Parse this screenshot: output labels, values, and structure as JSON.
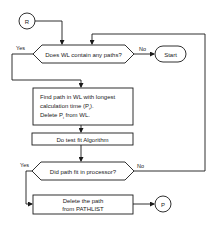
{
  "diagram": {
    "type": "flowchart",
    "nodes": {
      "entry_connector": {
        "label": "R",
        "shape": "circle"
      },
      "decision_wl": {
        "label": "Does WL contain any paths?",
        "shape": "hexagon",
        "yes_label": "Yes",
        "no_label": "No"
      },
      "start": {
        "label": "Start",
        "shape": "oval"
      },
      "find_path": {
        "lines": [
          "Find path in WL with longest",
          "calculation time (P",
          "Delete P",
          " from WL."
        ],
        "subscript": "i",
        "line2_suffix": ")."
      },
      "test_fit": {
        "label": "Do test fit Algorithm"
      },
      "decision_fit": {
        "label": "Did path fit in processor?",
        "shape": "hexagon",
        "yes_label": "Yes",
        "no_label": "No"
      },
      "delete_path": {
        "lines": [
          "Delete the path",
          "from PATHLIST"
        ]
      },
      "exit_connector": {
        "label": "P",
        "shape": "circle"
      }
    },
    "colors": {
      "stroke": "#1a1a1a",
      "background": "#ffffff"
    }
  }
}
